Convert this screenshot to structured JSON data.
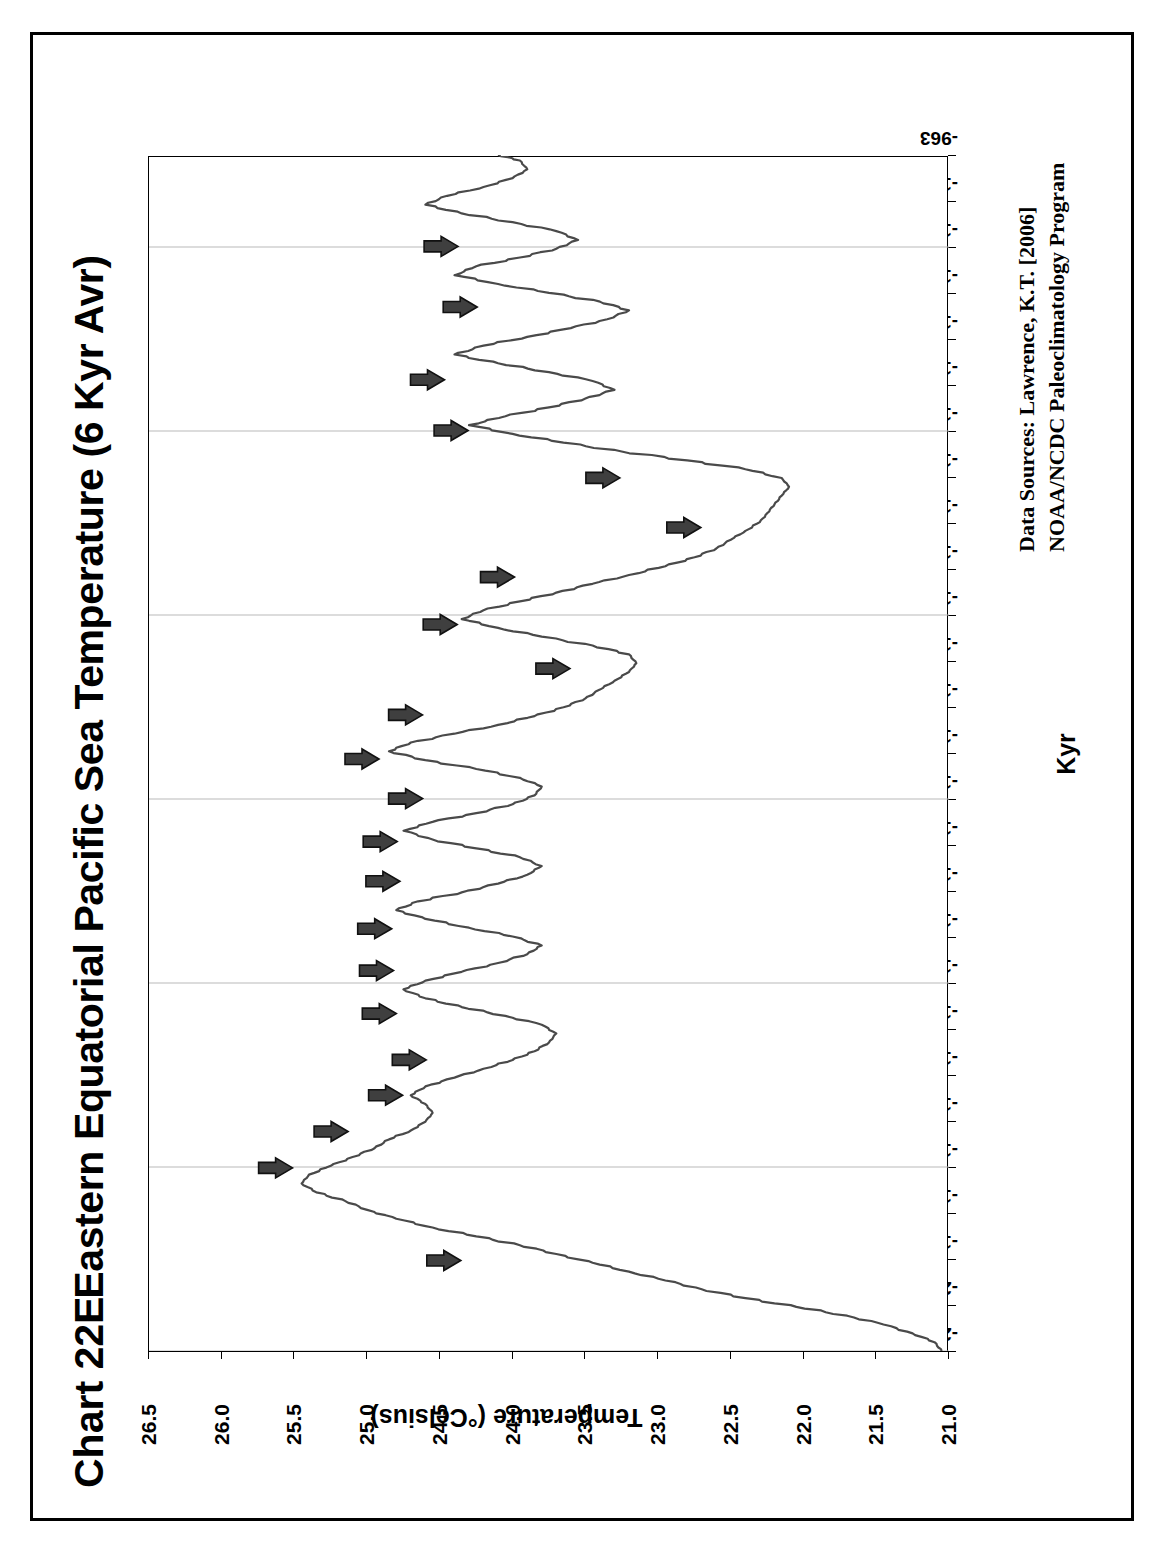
{
  "page": {
    "chart_id": "Chart 22E",
    "title": "Eastern Equatorial Pacific Sea Temperature (6 Kyr Avr)"
  },
  "axes": {
    "y_title": "Temperature (°Celsius)",
    "x_title": "Kyr"
  },
  "sources": {
    "line1": "Data Sources:  Lawrence, K.T. [2006]",
    "line2": "NOAA/NCDC Paleoclimatology Program"
  },
  "chart_data": {
    "type": "line",
    "title": "Eastern Equatorial Pacific Sea Temperature (6 Kyr Avr)",
    "xlabel": "Kyr",
    "ylabel": "Temperature (°Celsius)",
    "ylim": [
      21.0,
      26.5
    ],
    "ytick_labels": [
      "26.5",
      "26.0",
      "25.5",
      "25.0",
      "24.5",
      "24.0",
      "23.5",
      "23.0",
      "22.5",
      "22.0",
      "21.5",
      "21.0"
    ],
    "ytick_values": [
      26.5,
      26.0,
      25.5,
      25.0,
      24.5,
      24.0,
      23.5,
      23.0,
      22.5,
      22.0,
      21.5,
      21.0
    ],
    "xtick_labels": [
      "-2048",
      "-2006",
      "-1965",
      "-1923",
      "-1881",
      "-1839",
      "-1798",
      "-1756",
      "-1714",
      "-1673",
      "-1631",
      "-1589",
      "-1547",
      "-1506",
      "-1464",
      "-1422",
      "-1380",
      "-1339",
      "-1297",
      "-1255",
      "-1214",
      "-1172",
      "-1130",
      "-1088",
      "-1047",
      "-1005",
      "-963"
    ],
    "grid": "vertical-major-only",
    "legend": "none",
    "series": [
      {
        "name": "Eastern Equatorial Pacific SST (6 Kyr average)",
        "x": [
          -2048,
          -2040,
          -2032,
          -2024,
          -2016,
          -2008,
          -2000,
          -1992,
          -1984,
          -1976,
          -1968,
          -1960,
          -1952,
          -1944,
          -1936,
          -1928,
          -1920,
          -1912,
          -1904,
          -1896,
          -1888,
          -1880,
          -1872,
          -1864,
          -1856,
          -1848,
          -1840,
          -1832,
          -1824,
          -1816,
          -1808,
          -1800,
          -1792,
          -1784,
          -1776,
          -1768,
          -1760,
          -1752,
          -1744,
          -1736,
          -1728,
          -1720,
          -1712,
          -1704,
          -1696,
          -1688,
          -1680,
          -1672,
          -1664,
          -1656,
          -1648,
          -1640,
          -1632,
          -1624,
          -1616,
          -1608,
          -1600,
          -1592,
          -1584,
          -1576,
          -1568,
          -1560,
          -1552,
          -1544,
          -1536,
          -1528,
          -1520,
          -1512,
          -1504,
          -1496,
          -1488,
          -1480,
          -1472,
          -1464,
          -1456,
          -1448,
          -1440,
          -1432,
          -1424,
          -1416,
          -1408,
          -1400,
          -1392,
          -1384,
          -1376,
          -1368,
          -1360,
          -1352,
          -1344,
          -1336,
          -1328,
          -1320,
          -1312,
          -1304,
          -1296,
          -1288,
          -1280,
          -1272,
          -1264,
          -1256,
          -1248,
          -1240,
          -1232,
          -1224,
          -1216,
          -1208,
          -1200,
          -1192,
          -1184,
          -1176,
          -1168,
          -1160,
          -1152,
          -1144,
          -1136,
          -1128,
          -1120,
          -1112,
          -1104,
          -1096,
          -1088,
          -1080,
          -1072,
          -1064,
          -1056,
          -1048,
          -1040,
          -1032,
          -1024,
          -1016,
          -1008,
          -1000,
          -992,
          -984,
          -976,
          -968,
          -963
        ],
        "y": [
          21.05,
          21.1,
          21.25,
          21.45,
          21.7,
          22.05,
          22.4,
          22.7,
          22.95,
          23.2,
          23.45,
          23.7,
          23.95,
          24.25,
          24.55,
          24.8,
          25.0,
          25.15,
          25.35,
          25.45,
          25.4,
          25.25,
          25.1,
          24.95,
          24.85,
          24.7,
          24.6,
          24.55,
          24.6,
          24.7,
          24.6,
          24.4,
          24.2,
          24.0,
          23.85,
          23.75,
          23.7,
          23.8,
          24.05,
          24.35,
          24.6,
          24.75,
          24.6,
          24.35,
          24.1,
          23.9,
          23.8,
          24.0,
          24.3,
          24.6,
          24.8,
          24.65,
          24.35,
          24.1,
          23.9,
          23.8,
          23.95,
          24.25,
          24.55,
          24.75,
          24.55,
          24.25,
          24.0,
          23.85,
          23.8,
          23.95,
          24.25,
          24.6,
          24.85,
          24.7,
          24.4,
          24.1,
          23.85,
          23.65,
          23.5,
          23.4,
          23.3,
          23.2,
          23.15,
          23.2,
          23.45,
          23.8,
          24.1,
          24.35,
          24.2,
          23.95,
          23.7,
          23.45,
          23.2,
          22.95,
          22.75,
          22.6,
          22.5,
          22.4,
          22.3,
          22.25,
          22.2,
          22.15,
          22.1,
          22.15,
          22.4,
          22.8,
          23.25,
          23.65,
          24.0,
          24.3,
          24.05,
          23.75,
          23.5,
          23.3,
          23.45,
          23.75,
          24.1,
          24.4,
          24.2,
          23.9,
          23.6,
          23.35,
          23.2,
          23.4,
          23.75,
          24.1,
          24.4,
          24.25,
          23.95,
          23.7,
          23.55,
          23.7,
          24.0,
          24.35,
          24.6,
          24.45,
          24.2,
          24.0,
          23.9,
          23.95,
          24.1
        ]
      }
    ],
    "annotations": {
      "type": "arrow-markers",
      "description": "Solid dark-grey block arrows pointing at warm peaks along the record",
      "count": 22,
      "marker_kyr": [
        -1965,
        -1881,
        -1848,
        -1815,
        -1783,
        -1741,
        -1702,
        -1664,
        -1621,
        -1585,
        -1546,
        -1510,
        -1470,
        -1428,
        -1388,
        -1345,
        -1300,
        -1255,
        -1212,
        -1166,
        -1100,
        -1045
      ]
    }
  }
}
